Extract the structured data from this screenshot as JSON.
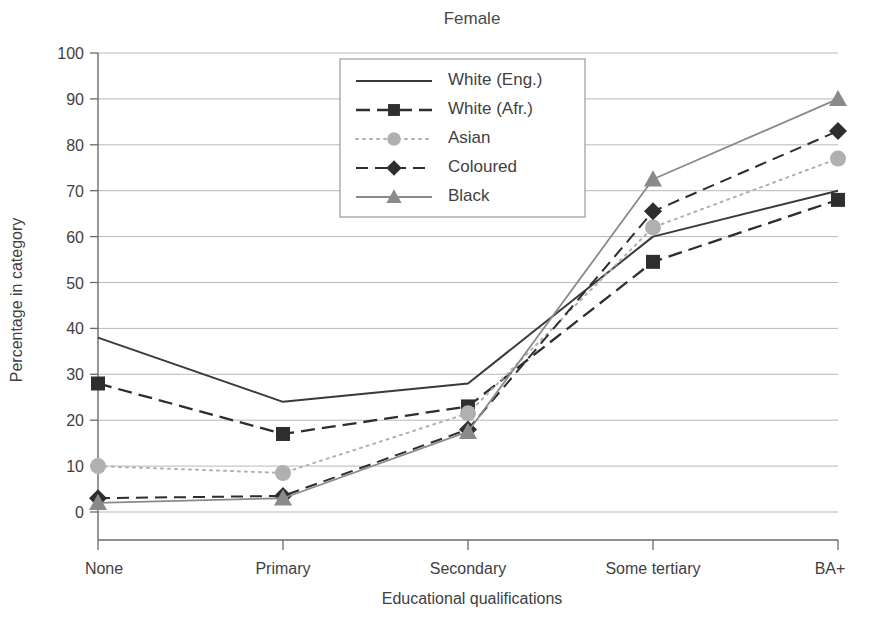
{
  "chart_data": {
    "type": "line",
    "title": "Female",
    "xlabel": "Educational qualifications",
    "ylabel": "Percentage in category",
    "categories": [
      "None",
      "Primary",
      "Secondary",
      "Some tertiary",
      "BA+"
    ],
    "ylim": [
      0,
      100
    ],
    "yticks": [
      0,
      10,
      20,
      30,
      40,
      50,
      60,
      70,
      80,
      90,
      100
    ],
    "grid": true,
    "legend_position": "upper center",
    "series": [
      {
        "name": "White (Eng.)",
        "values": [
          38,
          24,
          28,
          60,
          70
        ],
        "color": "#3a3a3a",
        "dash": "none",
        "marker": "none",
        "width": 2.0
      },
      {
        "name": "White (Afr.)",
        "values": [
          28,
          17,
          23,
          54.5,
          68
        ],
        "color": "#2e2e2e",
        "dash": "14,7",
        "marker": "square",
        "width": 2.3
      },
      {
        "name": "Asian",
        "values": [
          10,
          8.5,
          21.5,
          62,
          77
        ],
        "color": "#b0b0b0",
        "dash": "2,5",
        "marker": "circle",
        "width": 2.0
      },
      {
        "name": "Coloured",
        "values": [
          3,
          3.5,
          18,
          65.5,
          83
        ],
        "color": "#2e2e2e",
        "dash": "12,7",
        "marker": "diamond",
        "width": 2.0
      },
      {
        "name": "Black",
        "values": [
          2,
          3,
          17.5,
          72.5,
          90
        ],
        "color": "#8a8a8a",
        "dash": "none",
        "marker": "triangle",
        "width": 1.8
      }
    ]
  }
}
